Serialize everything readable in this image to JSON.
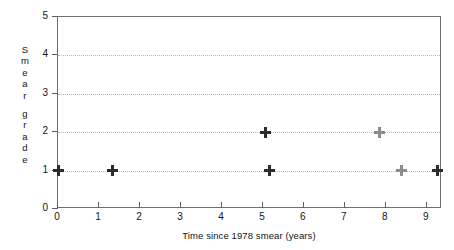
{
  "chart_data": {
    "type": "scatter",
    "title": "",
    "xlabel": "Time since 1978 smear (years)",
    "ylabel": "Smear grade",
    "ylabel_letters": [
      "S",
      "m",
      "e",
      "a",
      "r",
      "g",
      "r",
      "a",
      "d",
      "e"
    ],
    "ylabel_word_break_after_index": 4,
    "xlim": [
      0,
      9.37
    ],
    "ylim": [
      0,
      5
    ],
    "xticks": [
      0,
      1,
      2,
      3,
      4,
      5,
      6,
      7,
      8,
      9
    ],
    "xtick_labels": [
      "0",
      "1",
      "2",
      "3",
      "4",
      "5",
      "6",
      "7",
      "8",
      "9"
    ],
    "yticks": [
      0,
      1,
      2,
      3,
      4,
      5
    ],
    "ytick_labels": [
      "0",
      "1",
      "2",
      "3",
      "4",
      "5"
    ],
    "grid": true,
    "grid_axis": "y",
    "grid_values": [
      1,
      2,
      3,
      4
    ],
    "grid_style": "dotted",
    "legend": null,
    "marker": "plus",
    "points": [
      {
        "x": 0.0,
        "y": 1,
        "faded": false
      },
      {
        "x": 1.32,
        "y": 1,
        "faded": false
      },
      {
        "x": 5.07,
        "y": 2,
        "faded": false
      },
      {
        "x": 5.17,
        "y": 1,
        "faded": false
      },
      {
        "x": 7.84,
        "y": 2,
        "faded": true
      },
      {
        "x": 8.39,
        "y": 1,
        "faded": true
      },
      {
        "x": 9.25,
        "y": 1,
        "faded": false
      }
    ],
    "colors": {
      "marker": "#2b2b2b",
      "marker_faded": "#8c8c8c",
      "axis": "#6e6e6e",
      "grid": "#b9b9b9",
      "text": "#141414",
      "background": "#ffffff"
    }
  }
}
